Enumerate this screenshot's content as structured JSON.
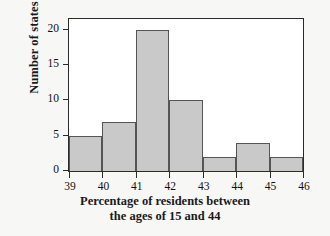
{
  "chart_data": {
    "type": "bar",
    "subtype": "histogram",
    "title": "",
    "xlabel_line1": "Percentage of residents between",
    "xlabel_line2": "the ages of 15 and 44",
    "xlabel": "Percentage of residents between the ages of 15 and 44",
    "ylabel": "Number of states",
    "categories": [
      "39-40",
      "40-41",
      "41-42",
      "42-43",
      "43-44",
      "44-45",
      "45-46"
    ],
    "bin_edges": [
      39,
      40,
      41,
      42,
      43,
      44,
      45,
      46
    ],
    "values": [
      5,
      7,
      20,
      10,
      2,
      4,
      2
    ],
    "xlim": [
      39,
      46
    ],
    "ylim": [
      0,
      21.5
    ],
    "xticks": [
      39,
      40,
      41,
      42,
      43,
      44,
      45,
      46
    ],
    "yticks": [
      0,
      5,
      10,
      15,
      20
    ],
    "xtick_labels": [
      "39",
      "40",
      "41",
      "42",
      "43",
      "44",
      "45",
      "46"
    ],
    "ytick_labels": [
      "0",
      "5",
      "10",
      "15",
      "20"
    ],
    "grid": false,
    "legend": false,
    "bar_fill_color": "#c9c9c9",
    "bar_edge_color": "#555555",
    "axis_color": "#2b2b2b",
    "plot_background": "#ffffff",
    "figure_background": "#f7f7f6"
  }
}
